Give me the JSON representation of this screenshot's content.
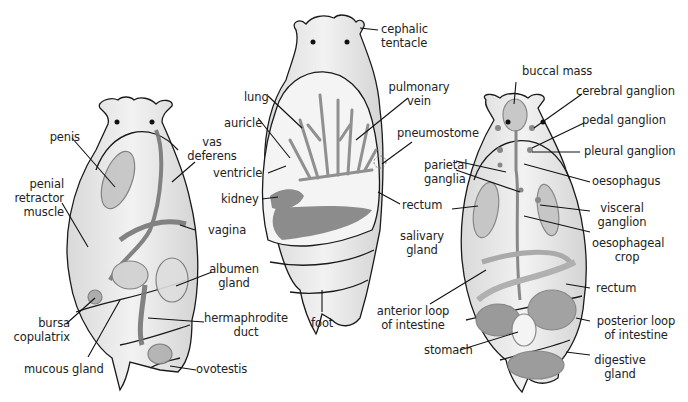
{
  "figure": {
    "colors": {
      "outline": "#1a1a1a",
      "body_fill": "#e8e8e8",
      "organ_fill": "#bdbdbd",
      "dark_organ": "#8a8a8a",
      "background": "#ffffff"
    }
  },
  "panels": [
    {
      "id": "reproductive",
      "labels": [
        {
          "text": "penis"
        },
        {
          "text": "penial\nretractor\nmuscle"
        },
        {
          "text": "vas\ndeferens"
        },
        {
          "text": "vagina"
        },
        {
          "text": "albumen\ngland"
        },
        {
          "text": "bursa\ncopulatrix"
        },
        {
          "text": "hermaphrodite\nduct"
        },
        {
          "text": "mucous gland"
        },
        {
          "text": "ovotestis"
        }
      ]
    },
    {
      "id": "respiratory",
      "labels": [
        {
          "text": "cephalic\ntentacle"
        },
        {
          "text": "lung"
        },
        {
          "text": "pulmonary\nvein"
        },
        {
          "text": "auricle"
        },
        {
          "text": "pneumostome"
        },
        {
          "text": "ventricle"
        },
        {
          "text": "kidney"
        },
        {
          "text": "rectum"
        },
        {
          "text": "foot"
        }
      ]
    },
    {
      "id": "digestive-nervous",
      "labels": [
        {
          "text": "buccal mass"
        },
        {
          "text": "cerebral ganglion"
        },
        {
          "text": "pedal ganglion"
        },
        {
          "text": "pleural ganglion"
        },
        {
          "text": "parietal\nganglia"
        },
        {
          "text": "oesophagus"
        },
        {
          "text": "visceral\nganglion"
        },
        {
          "text": "salivary\ngland"
        },
        {
          "text": "oesophageal\ncrop"
        },
        {
          "text": "rectum"
        },
        {
          "text": "anterior loop\nof intestine"
        },
        {
          "text": "posterior loop\nof intestine"
        },
        {
          "text": "stomach"
        },
        {
          "text": "digestive\ngland"
        }
      ]
    }
  ]
}
